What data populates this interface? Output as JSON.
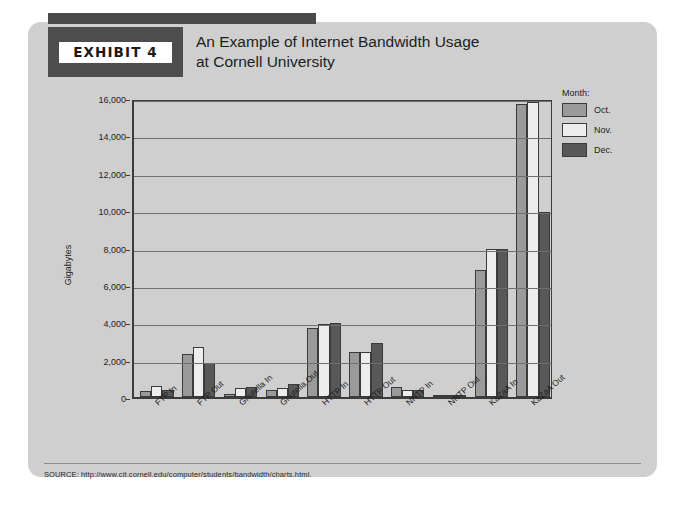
{
  "exhibit": {
    "badge": "EXHIBIT 4",
    "title_line1": "An Example of Internet Bandwidth Usage",
    "title_line2": "at Cornell University"
  },
  "source": {
    "text": "SOURCE: http://www.cit.cornell.edu/computer/students/bandwidth/charts.html."
  },
  "legend": {
    "title": "Month:",
    "items": [
      {
        "label": "Oct.",
        "color": "#9a9a9a"
      },
      {
        "label": "Nov.",
        "color": "#ededed"
      },
      {
        "label": "Dec.",
        "color": "#585858"
      }
    ]
  },
  "colors": {
    "card_background": "#cfcfcf",
    "badge_block": "#4d4d4d",
    "axis": "#3c3c3c",
    "gridline": "#6f6f6f",
    "oct": "#9a9a9a",
    "nov": "#ededed",
    "dec": "#585858"
  },
  "chart_data": {
    "type": "bar",
    "title": "An Example of Internet Bandwidth Usage at Cornell University",
    "xlabel": "",
    "ylabel": "Gigabytes",
    "ylim": [
      0,
      16000
    ],
    "ytick_values": [
      0,
      2000,
      4000,
      6000,
      8000,
      10000,
      12000,
      14000,
      16000
    ],
    "ytick_labels": [
      "0",
      "2,000",
      "4,000",
      "6,000",
      "8,000",
      "10,000",
      "12,000",
      "14,000",
      "16,000"
    ],
    "grid": true,
    "legend_position": "right",
    "categories": [
      "FTP In",
      "FTP Out",
      "Gnutella In",
      "Gnutella Out",
      "HTTP In",
      "HTTP Out",
      "NNTP In",
      "NNTP Out",
      "KaZaA In",
      "KaZaA Out"
    ],
    "series": [
      {
        "name": "Oct.",
        "color": "#9a9a9a",
        "values": [
          300,
          2300,
          150,
          400,
          3700,
          2400,
          550,
          60,
          6800,
          15700
        ]
      },
      {
        "name": "Nov.",
        "color": "#ededed",
        "values": [
          600,
          2700,
          500,
          500,
          3900,
          2400,
          400,
          60,
          7900,
          15800
        ]
      },
      {
        "name": "Dec.",
        "color": "#585858",
        "values": [
          350,
          1800,
          550,
          700,
          3950,
          2900,
          400,
          60,
          7900,
          9900
        ]
      }
    ]
  }
}
